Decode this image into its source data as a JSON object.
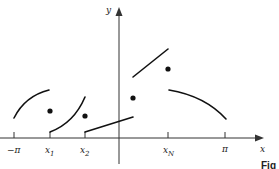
{
  "diagram": {
    "axes": {
      "x_label": "x",
      "y_label": "y"
    },
    "ticks": [
      {
        "label": "−π",
        "sub": ""
      },
      {
        "label": "x",
        "sub": "1"
      },
      {
        "label": "x",
        "sub": "2"
      },
      {
        "label": "x",
        "sub": "N"
      },
      {
        "label": "π",
        "sub": ""
      }
    ],
    "caption": "Fig",
    "colors": {
      "stroke": "#111111",
      "axis": "#333333",
      "background": "#ffffff"
    }
  }
}
